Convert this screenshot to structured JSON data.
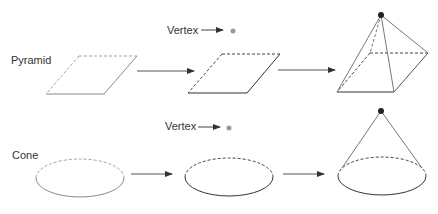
{
  "rows": [
    {
      "label": "Pyramid",
      "vertex_label": "Vertex",
      "steps": [
        "base",
        "base-with-vertex",
        "pyramid"
      ]
    },
    {
      "label": "Cone",
      "vertex_label": "Vertex",
      "steps": [
        "base",
        "base-with-vertex",
        "cone"
      ]
    }
  ],
  "colors": {
    "line": "#555555",
    "dashed_light": "#9a9a9a",
    "vertex_dot_hint": "#999999",
    "vertex_dot_apex": "#222222",
    "text": "#333333"
  }
}
